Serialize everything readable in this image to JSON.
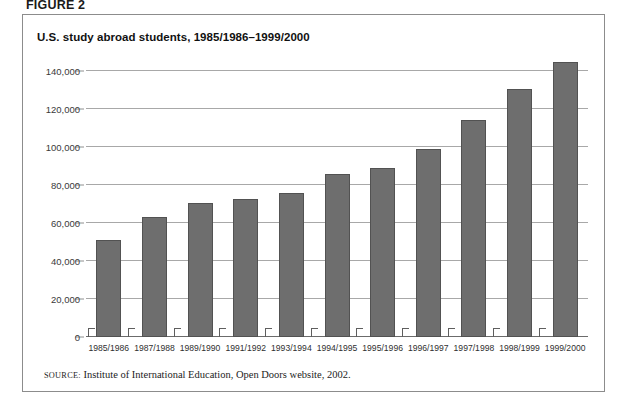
{
  "figure": {
    "label": "FIGURE 2",
    "title": "U.S. study abroad students, 1985/1986–1999/2000",
    "source_prefix": "SOURCE:",
    "source_text": " Institute of International Education, Open Doors website, 2002."
  },
  "colors": {
    "bar_fill": "#6e6e6e",
    "bar_stroke": "#525252",
    "gridline": "#a8a8a8",
    "panel_border": "#8c8c8c",
    "text": "#1c1c1c"
  },
  "chart_data": {
    "type": "bar",
    "title": "U.S. study abroad students, 1985/1986–1999/2000",
    "xlabel": "",
    "ylabel": "",
    "ylim": [
      0,
      150000
    ],
    "grid": true,
    "legend": "none",
    "yticks": [
      0,
      20000,
      40000,
      60000,
      80000,
      100000,
      120000,
      140000
    ],
    "ytick_labels": [
      "0",
      "20,000",
      "40,000",
      "60,000",
      "80,000",
      "100,000",
      "120,000",
      "140,000"
    ],
    "categories": [
      "1985/1986",
      "1987/1988",
      "1989/1990",
      "1991/1992",
      "1993/1994",
      "1994/1995",
      "1995/1996",
      "1996/1997",
      "1997/1998",
      "1998/1999",
      "1999/2000"
    ],
    "values": [
      51000,
      63000,
      70500,
      72500,
      76000,
      86000,
      89000,
      99000,
      114000,
      130500,
      144500
    ]
  }
}
